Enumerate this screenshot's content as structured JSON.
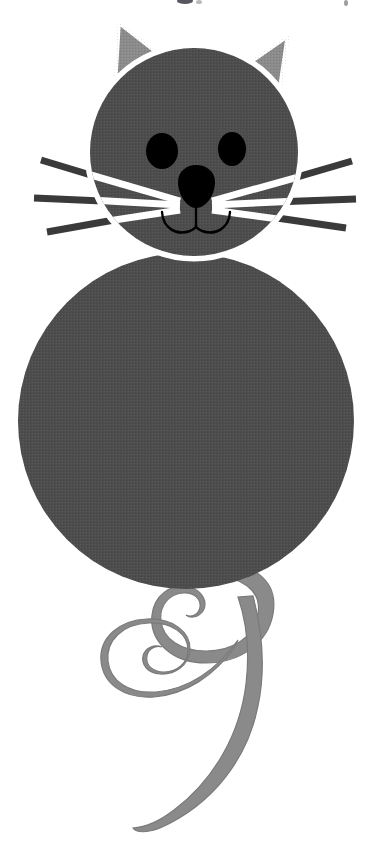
{
  "image": {
    "subject": "cartoon-cat-clipart",
    "title": "Cartoon grey cat with curly tail",
    "alt_text": "Clip art of a grey cartoon cat made of two circles with triangular ears, black eyes, black nose, whiskers and a curly spiral tail",
    "width": 387,
    "height": 866,
    "background_color": "#ffffff",
    "style": "halftone-scanned-clipart"
  },
  "palette": {
    "background": "#ffffff",
    "fur_dark": "#4d4d4d",
    "fur_dark_edge": "#555555",
    "ear_inner": "#8c8c8c",
    "tail_gray": "#8a8a8a",
    "tail_edge": "#7a7a7a",
    "outline_white": "#ffffff",
    "feature_black": "#000000",
    "whisker_outer": "#3a3a3a",
    "artifact_gray": "#4a4a55"
  },
  "parts": {
    "head": {
      "name": "head",
      "shape": "circle",
      "cx": 194,
      "cy": 152,
      "r": 104,
      "fill": "#4d4d4d",
      "outline": "#ffffff",
      "outline_width": 5
    },
    "ear_left": {
      "name": "left-ear",
      "shape": "triangle",
      "points": "118,21 177,67 113,103",
      "fill": "#8c8c8c",
      "outline": "#ffffff",
      "outline_width": 5
    },
    "ear_right": {
      "name": "right-ear",
      "shape": "triangle",
      "points": "289,34 278,108 237,70",
      "fill": "#8c8c8c",
      "outline": "#ffffff",
      "outline_width": 5
    },
    "eye_left": {
      "name": "left-eye",
      "shape": "ellipse",
      "cx": 162,
      "cy": 151,
      "rx": 16,
      "ry": 18,
      "fill": "#000000"
    },
    "eye_right": {
      "name": "right-eye",
      "shape": "ellipse",
      "cx": 232,
      "cy": 149,
      "rx": 14,
      "ry": 17,
      "fill": "#000000"
    },
    "nose": {
      "name": "nose",
      "shape": "rounded-triangle",
      "cx": 196,
      "cy": 192,
      "rx": 21,
      "ry": 17,
      "fill": "#000000"
    },
    "mouth": {
      "name": "mouth",
      "shape": "double-curve",
      "stroke": "#000000",
      "stroke_width": 2,
      "center_x": 196,
      "top_y": 205,
      "bottom_y": 232
    },
    "body": {
      "name": "body",
      "shape": "circle",
      "cx": 186,
      "cy": 421,
      "r": 168,
      "fill": "#4d4d4d"
    },
    "tail": {
      "name": "tail",
      "shape": "spiral-ribbon",
      "fill": "#8a8a8a",
      "stroke": "#7a7a7a",
      "loops": 2,
      "tip_x": 133,
      "tip_y": 828
    }
  },
  "whiskers": {
    "name": "whiskers",
    "count_per_side": 3,
    "inner_color": "#ffffff",
    "outer_color": "#3a3a3a",
    "left": [
      {
        "id": "left-whisker-upper",
        "x1": 41,
        "y1": 160,
        "x2": 166,
        "y2": 199
      },
      {
        "id": "left-whisker-middle",
        "x1": 34,
        "y1": 198,
        "x2": 166,
        "y2": 204
      },
      {
        "id": "left-whisker-lower",
        "x1": 47,
        "y1": 232,
        "x2": 166,
        "y2": 209
      }
    ],
    "right": [
      {
        "id": "right-whisker-upper",
        "x1": 352,
        "y1": 161,
        "x2": 226,
        "y2": 199
      },
      {
        "id": "right-whisker-middle",
        "x1": 356,
        "y1": 199,
        "x2": 226,
        "y2": 204
      },
      {
        "id": "right-whisker-lower",
        "x1": 346,
        "y1": 228,
        "x2": 226,
        "y2": 209
      }
    ]
  },
  "artifacts": {
    "description": "faint cropped marks along the top edge of the scan",
    "marks": [
      {
        "id": "top-artifact-1",
        "x": 178,
        "y": 0,
        "w": 14,
        "h": 4,
        "fill": "#3a3a44"
      },
      {
        "id": "top-artifact-2",
        "x": 196,
        "y": 1,
        "w": 5,
        "h": 3,
        "fill": "#6a6a72"
      },
      {
        "id": "top-artifact-3",
        "x": 345,
        "y": 1,
        "w": 3,
        "h": 4,
        "fill": "#5a5a64"
      }
    ]
  }
}
